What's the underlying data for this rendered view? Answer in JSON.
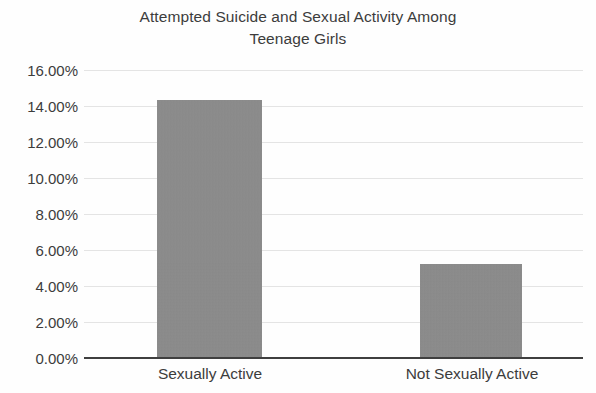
{
  "chart_data": {
    "type": "bar",
    "title": "Attempted Suicide and Sexual Activity Among Teenage Girls",
    "title_lines": [
      "Attempted Suicide and Sexual Activity Among",
      "Teenage Girls"
    ],
    "categories": [
      "Sexually Active",
      "Not Sexually Active"
    ],
    "values": [
      14.35,
      5.2
    ],
    "value_labels": [
      "14.35%",
      "5.20%"
    ],
    "xlabel": "",
    "ylabel": "",
    "ylim": [
      0,
      16
    ],
    "ytick_labels": [
      "16.00%",
      "14.00%",
      "12.00%",
      "10.00%",
      "8.00%",
      "6.00%",
      "4.00%",
      "2.00%",
      "0.00%"
    ],
    "ytick_values": [
      16,
      14,
      12,
      10,
      8,
      6,
      4,
      2,
      0
    ],
    "grid": true,
    "legend": false,
    "bar_color": "#8c8c8c",
    "gridline_color": "#e4e4e4",
    "axis_color": "#3f3f3f",
    "text_color": "#3c3c3c",
    "background_color": "#ffffff"
  }
}
